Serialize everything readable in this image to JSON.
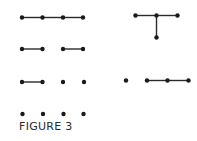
{
  "figure": {
    "caption": "FIGURE 3",
    "colors": {
      "vertex": "#1a1a1a",
      "edge": "#2a2a2a",
      "background": "#ffffff"
    },
    "graphs": [
      {
        "id": "row1-path4",
        "vertices": [
          [
            22,
            17.5
          ],
          [
            42.5,
            17.5
          ],
          [
            63,
            17.5
          ],
          [
            83,
            17.5
          ]
        ],
        "edges": [
          [
            0,
            1
          ],
          [
            1,
            2
          ],
          [
            2,
            3
          ]
        ]
      },
      {
        "id": "row2-two-edges",
        "vertices": [
          [
            22,
            49
          ],
          [
            42.5,
            49
          ],
          [
            63,
            49
          ],
          [
            83,
            49
          ]
        ],
        "edges": [
          [
            0,
            1
          ],
          [
            2,
            3
          ]
        ]
      },
      {
        "id": "row3-one-edge",
        "vertices": [
          [
            22,
            82
          ],
          [
            42.5,
            82
          ],
          [
            63,
            82
          ],
          [
            84,
            82
          ]
        ],
        "edges": [
          [
            0,
            1
          ]
        ]
      },
      {
        "id": "row4-empty",
        "vertices": [
          [
            22.5,
            114
          ],
          [
            43,
            114
          ],
          [
            63.5,
            114
          ],
          [
            83.5,
            114
          ]
        ],
        "edges": []
      },
      {
        "id": "right-star",
        "vertices": [
          [
            135.5,
            15.5
          ],
          [
            156.5,
            15.5
          ],
          [
            177.5,
            15.5
          ],
          [
            156.5,
            37.5
          ]
        ],
        "edges": [
          [
            0,
            1
          ],
          [
            1,
            2
          ],
          [
            1,
            3
          ]
        ]
      },
      {
        "id": "right-path3-plus-isolated",
        "vertices": [
          [
            126,
            80.5
          ],
          [
            147,
            80.5
          ],
          [
            167.5,
            80.5
          ],
          [
            188.5,
            80.5
          ]
        ],
        "edges": [
          [
            1,
            2
          ],
          [
            2,
            3
          ]
        ]
      }
    ]
  }
}
